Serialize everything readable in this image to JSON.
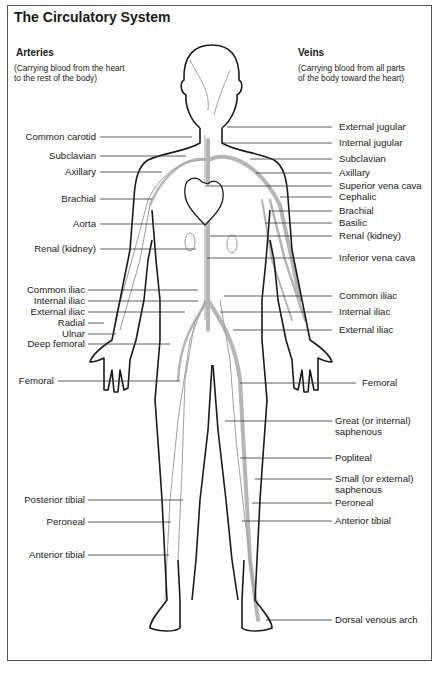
{
  "title": "The Circulatory System",
  "arteries": {
    "heading": "Arteries",
    "description_line1": "(Carrying blood from the heart",
    "description_line2": "to the rest of the body)",
    "labels": [
      {
        "text": "Common carotid",
        "y": 137
      },
      {
        "text": "Subclavian",
        "y": 156
      },
      {
        "text": "Axillary",
        "y": 172
      },
      {
        "text": "Brachial",
        "y": 199
      },
      {
        "text": "Aorta",
        "y": 224
      },
      {
        "text": "Renal (kidney)",
        "y": 249
      },
      {
        "text": "Common iliac",
        "y": 290
      },
      {
        "text": "Internal iliac",
        "y": 301
      },
      {
        "text": "External iliac",
        "y": 312
      },
      {
        "text": "Radial",
        "y": 323
      },
      {
        "text": "Ulnar",
        "y": 334
      },
      {
        "text": "Deep femoral",
        "y": 344
      },
      {
        "text": "Femoral",
        "y": 381
      },
      {
        "text": "Posterior tibial",
        "y": 500
      },
      {
        "text": "Peroneal",
        "y": 522
      },
      {
        "text": "Anterior tibial",
        "y": 555
      }
    ]
  },
  "veins": {
    "heading": "Veins",
    "description_line1": "(Carrying blood from all parts",
    "description_line2": "of the body toward the heart)",
    "labels": [
      {
        "text": "External jugular",
        "y": 127
      },
      {
        "text": "Internal jugular",
        "y": 143
      },
      {
        "text": "Subclavian",
        "y": 159
      },
      {
        "text": "Axillary",
        "y": 173
      },
      {
        "text": "Superior vena cava",
        "y": 186
      },
      {
        "text": "Cephalic",
        "y": 197
      },
      {
        "text": "Brachial",
        "y": 211
      },
      {
        "text": "Basilic",
        "y": 223
      },
      {
        "text": "Renal (kidney)",
        "y": 236
      },
      {
        "text": "Inferior vena cava",
        "y": 258
      },
      {
        "text": "Common iliac",
        "y": 296
      },
      {
        "text": "Internal iliac",
        "y": 312
      },
      {
        "text": "External iliac",
        "y": 330
      },
      {
        "text": "Femoral",
        "y": 383
      },
      {
        "text": "Great (or internal)",
        "y": 421
      },
      {
        "text": "saphenous",
        "y": 432
      },
      {
        "text": "Popliteal",
        "y": 458
      },
      {
        "text": "Small (or external)",
        "y": 479
      },
      {
        "text": "saphenous",
        "y": 490
      },
      {
        "text": "Peroneal",
        "y": 503
      },
      {
        "text": "Anterior tibial",
        "y": 521
      },
      {
        "text": "Dorsal venous arch",
        "y": 620
      }
    ]
  },
  "colors": {
    "outline": "#1a1a1a",
    "vein": "#b0b0b0",
    "artery_fine": "#9a9a9a",
    "leader": "#333333",
    "frame": "#555555"
  }
}
